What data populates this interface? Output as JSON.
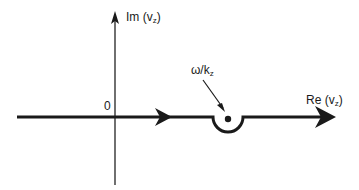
{
  "diagram": {
    "type": "complex-plane-contour",
    "axes": {
      "imaginary": {
        "label_main": "Im (v",
        "label_sub": "z",
        "label_close": ")"
      },
      "real": {
        "label_main": "Re (v",
        "label_sub": "z",
        "label_close": ")"
      },
      "origin_label": "0"
    },
    "pole": {
      "label_main": "ω/k",
      "label_sub": "z"
    },
    "contour": {
      "description": "Landau contour along real axis, indented below the pole at ω/k_z",
      "direction": "left-to-right"
    },
    "colors": {
      "stroke": "#1a1a1a",
      "background": "#ffffff"
    }
  }
}
